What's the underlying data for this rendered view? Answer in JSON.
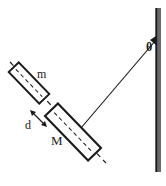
{
  "figure": {
    "background_color": "#ffffff",
    "stroke_color": "#1a1a1a"
  },
  "labels": {
    "small_block": "m",
    "large_block": "M",
    "gap": "d",
    "angle": "θ"
  },
  "elements": {
    "wall": {
      "name": "vertical-wall",
      "x": 156,
      "y_top": 8,
      "y_bottom": 172,
      "thickness": 4
    },
    "string": {
      "name": "string",
      "x1": 156,
      "y1": 40,
      "x2": 81,
      "y2": 128
    },
    "axis": {
      "name": "dashed-axis",
      "x1": 10,
      "y1": 62,
      "x2": 106,
      "y2": 163,
      "style": "dashed"
    },
    "small_block": {
      "name": "block-m",
      "cx": 29,
      "cy": 83,
      "length": 44,
      "width": 14,
      "rotation_deg": 46
    },
    "large_block": {
      "name": "block-M",
      "cx": 73,
      "cy": 132,
      "length": 62,
      "width": 18,
      "rotation_deg": 46
    },
    "gap_arrow": {
      "name": "gap-arrow",
      "x1": 31,
      "y1": 111,
      "x2": 45,
      "y2": 125,
      "double_headed": true
    }
  }
}
